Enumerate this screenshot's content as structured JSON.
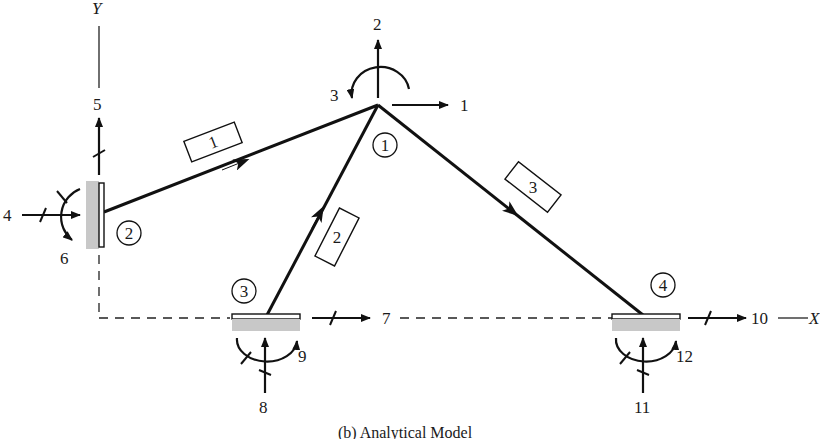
{
  "figure": {
    "caption": "(b) Analytical Model",
    "axes": {
      "x_label": "X",
      "y_label": "Y"
    }
  },
  "joints": [
    {
      "id": "1",
      "label": "1",
      "type": "free",
      "dofs": [
        "1",
        "2",
        "3"
      ]
    },
    {
      "id": "2",
      "label": "2",
      "type": "fixed-support",
      "dofs": [
        "4",
        "5",
        "6"
      ]
    },
    {
      "id": "3",
      "label": "3",
      "type": "fixed-support",
      "dofs": [
        "7",
        "8",
        "9"
      ]
    },
    {
      "id": "4",
      "label": "4",
      "type": "fixed-support",
      "dofs": [
        "10",
        "11",
        "12"
      ]
    }
  ],
  "members": [
    {
      "id": "1",
      "label": "1",
      "from_joint": "2",
      "to_joint": "1"
    },
    {
      "id": "2",
      "label": "2",
      "from_joint": "3",
      "to_joint": "1"
    },
    {
      "id": "3",
      "label": "3",
      "from_joint": "1",
      "to_joint": "4"
    }
  ],
  "dof_labels": {
    "d1": "1",
    "d2": "2",
    "d3": "3",
    "d4": "4",
    "d5": "5",
    "d6": "6",
    "d7": "7",
    "d8": "8",
    "d9": "9",
    "d10": "10",
    "d11": "11",
    "d12": "12"
  },
  "colors": {
    "line": "#111111",
    "support_hatch": "#c8c8c8",
    "background": "#ffffff"
  }
}
